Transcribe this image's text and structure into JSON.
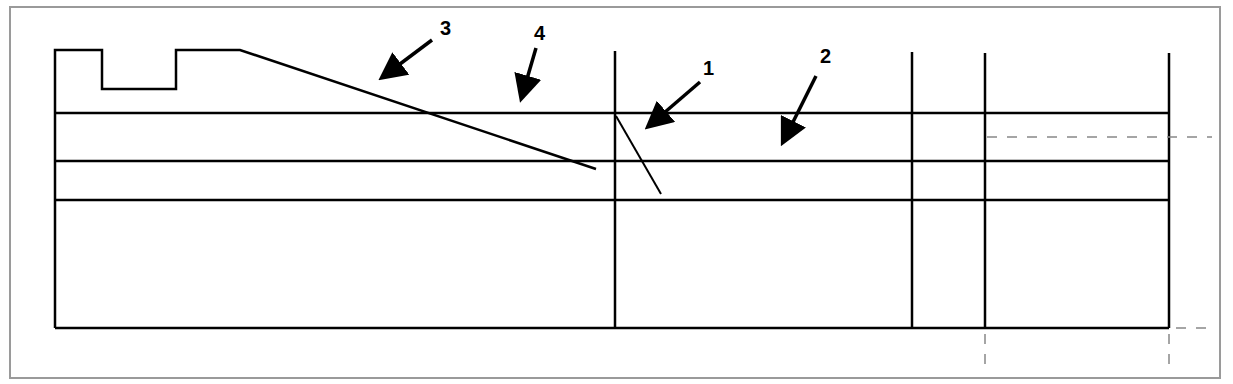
{
  "figure": {
    "frame_color": "#9a9a9a",
    "line_color": "#000000",
    "dash_color": "#888888",
    "callouts": [
      {
        "id": "callout-3",
        "label": "3",
        "x": 446,
        "y": 34
      },
      {
        "id": "callout-4",
        "label": "4",
        "x": 540,
        "y": 42
      },
      {
        "id": "callout-1",
        "label": "1",
        "x": 709,
        "y": 75
      },
      {
        "id": "callout-2",
        "label": "2",
        "x": 826,
        "y": 63
      }
    ]
  }
}
